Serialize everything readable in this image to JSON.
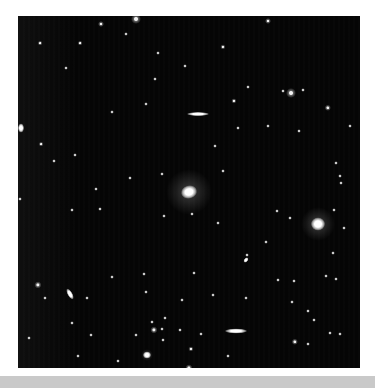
{
  "image": {
    "subject": "deep-sky galaxy field",
    "background_color": "#050505",
    "frame_color": "#ffffff",
    "bottom_bar_color": "#c9c9c9"
  },
  "objects": [
    {
      "type": "elliptical-galaxy",
      "x": 171,
      "y": 176,
      "w": 16,
      "h": 13,
      "halo": 46,
      "angle": -15
    },
    {
      "type": "elliptical-galaxy",
      "x": 300,
      "y": 208,
      "w": 14,
      "h": 13,
      "halo": 34,
      "angle": 0
    },
    {
      "type": "edge-on-galaxy",
      "x": 180,
      "y": 98,
      "w": 22,
      "h": 4,
      "halo": 0,
      "angle": 0
    },
    {
      "type": "edge-on-galaxy",
      "x": 218,
      "y": 315,
      "w": 22,
      "h": 5,
      "halo": 0,
      "angle": 0
    },
    {
      "type": "spiral-galaxy",
      "x": 52,
      "y": 278,
      "w": 12,
      "h": 5,
      "halo": 0,
      "angle": 60
    },
    {
      "type": "galaxy",
      "x": 3,
      "y": 112,
      "w": 6,
      "h": 9,
      "halo": 0,
      "angle": 0
    },
    {
      "type": "galaxy",
      "x": 228,
      "y": 244,
      "w": 6,
      "h": 4,
      "halo": 0,
      "angle": -50
    },
    {
      "type": "galaxy",
      "x": 129,
      "y": 339,
      "w": 8,
      "h": 7,
      "halo": 12,
      "angle": 0
    }
  ],
  "stars": [
    [
      118,
      3,
      2.5
    ],
    [
      83,
      8,
      1.5
    ],
    [
      250,
      5,
      1.5
    ],
    [
      22,
      27,
      1.2
    ],
    [
      62,
      27,
      1.2
    ],
    [
      108,
      18,
      1
    ],
    [
      205,
      31,
      1.3
    ],
    [
      140,
      37,
      1
    ],
    [
      167,
      50,
      1
    ],
    [
      48,
      52,
      1
    ],
    [
      137,
      63,
      1
    ],
    [
      230,
      71,
      1
    ],
    [
      265,
      75,
      1
    ],
    [
      273,
      77,
      2.5
    ],
    [
      285,
      74,
      1
    ],
    [
      216,
      85,
      1.3
    ],
    [
      310,
      92,
      1.6
    ],
    [
      128,
      88,
      1
    ],
    [
      94,
      96,
      1
    ],
    [
      220,
      112,
      1
    ],
    [
      250,
      110,
      1
    ],
    [
      281,
      115,
      1
    ],
    [
      332,
      110,
      1
    ],
    [
      23,
      128,
      1.2
    ],
    [
      57,
      139,
      1
    ],
    [
      36,
      145,
      1
    ],
    [
      197,
      130,
      1
    ],
    [
      318,
      147,
      1
    ],
    [
      322,
      160,
      1
    ],
    [
      323,
      167,
      1
    ],
    [
      78,
      173,
      1
    ],
    [
      112,
      162,
      1
    ],
    [
      144,
      158,
      1
    ],
    [
      205,
      155,
      1
    ],
    [
      2,
      183,
      1
    ],
    [
      54,
      194,
      1
    ],
    [
      82,
      193,
      1
    ],
    [
      146,
      200,
      1
    ],
    [
      174,
      198,
      1
    ],
    [
      200,
      207,
      1
    ],
    [
      259,
      195,
      1
    ],
    [
      272,
      202,
      1
    ],
    [
      316,
      194,
      1
    ],
    [
      326,
      212,
      1
    ],
    [
      248,
      226,
      1
    ],
    [
      315,
      237,
      1
    ],
    [
      229,
      239,
      1
    ],
    [
      94,
      261,
      1
    ],
    [
      126,
      258,
      1
    ],
    [
      176,
      257,
      1
    ],
    [
      260,
      264,
      1
    ],
    [
      276,
      265,
      1
    ],
    [
      308,
      260,
      1
    ],
    [
      318,
      263,
      1
    ],
    [
      20,
      269,
      1.8
    ],
    [
      27,
      282,
      1
    ],
    [
      69,
      282,
      1
    ],
    [
      128,
      276,
      1
    ],
    [
      164,
      284,
      1
    ],
    [
      195,
      279,
      1
    ],
    [
      228,
      282,
      1
    ],
    [
      274,
      286,
      1
    ],
    [
      290,
      295,
      1
    ],
    [
      296,
      304,
      1
    ],
    [
      147,
      302,
      1
    ],
    [
      134,
      306,
      1
    ],
    [
      54,
      307,
      1
    ],
    [
      136,
      314,
      1.8
    ],
    [
      144,
      313,
      1
    ],
    [
      162,
      314,
      1
    ],
    [
      183,
      318,
      1
    ],
    [
      118,
      319,
      1
    ],
    [
      312,
      317,
      1
    ],
    [
      322,
      318,
      1
    ],
    [
      11,
      322,
      1
    ],
    [
      73,
      319,
      1
    ],
    [
      145,
      324,
      1
    ],
    [
      277,
      326,
      1.6
    ],
    [
      290,
      328,
      1
    ],
    [
      173,
      333,
      1.3
    ],
    [
      210,
      340,
      1
    ],
    [
      171,
      352,
      1.8
    ],
    [
      60,
      340,
      1
    ],
    [
      100,
      345,
      1
    ]
  ]
}
